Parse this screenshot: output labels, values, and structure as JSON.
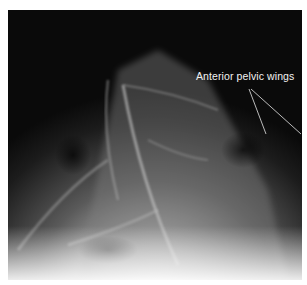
{
  "figure": {
    "type": "x-ray radiograph",
    "annotation": {
      "label": "Anterior pelvic wings",
      "pointer_count": 2
    },
    "colors": {
      "background": "#0a0a0a",
      "border": "#ffffff",
      "annotation": "#f2f2f2"
    }
  }
}
